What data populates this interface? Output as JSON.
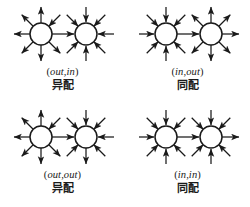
{
  "figure": {
    "type": "diagram",
    "title": "",
    "layout": "2x2-grid",
    "panel_count": 4
  },
  "panels": [
    {
      "id": "panel-out-in",
      "position": "top-left",
      "pair_open": "(",
      "pair_first": "out",
      "pair_comma": ",",
      "pair_second": "in",
      "pair_close": ")",
      "pair_label": "(out,in)",
      "cn_label": "异配",
      "left_node": {
        "name": "left-node",
        "hub_type": "out",
        "spoke_count": 8
      },
      "right_node": {
        "name": "right-node",
        "hub_type": "in",
        "spoke_count": 8
      },
      "edge_direction": "left-to-right"
    },
    {
      "id": "panel-in-out",
      "position": "top-right",
      "pair_open": "(",
      "pair_first": "in",
      "pair_comma": ",",
      "pair_second": "out",
      "pair_close": ")",
      "pair_label": "(in,out)",
      "cn_label": "同配",
      "left_node": {
        "name": "left-node",
        "hub_type": "in",
        "spoke_count": 8
      },
      "right_node": {
        "name": "right-node",
        "hub_type": "out",
        "spoke_count": 8
      },
      "edge_direction": "left-to-right"
    },
    {
      "id": "panel-out-out",
      "position": "bottom-left",
      "pair_open": "(",
      "pair_first": "out",
      "pair_comma": ",",
      "pair_second": "out",
      "pair_close": ")",
      "pair_label": "(out,out)",
      "cn_label": "异配",
      "left_node": {
        "name": "left-node",
        "hub_type": "out",
        "spoke_count": 8
      },
      "right_node": {
        "name": "right-node",
        "hub_type": "in",
        "spoke_count": 8
      },
      "edge_direction": "left-to-right"
    },
    {
      "id": "panel-in-in",
      "position": "bottom-right",
      "pair_open": "(",
      "pair_first": "in",
      "pair_comma": ",",
      "pair_second": "in",
      "pair_close": ")",
      "pair_label": "(in,in)",
      "cn_label": "同配",
      "left_node": {
        "name": "left-node",
        "hub_type": "in",
        "spoke_count": 8
      },
      "right_node": {
        "name": "right-node",
        "hub_type": "in",
        "spoke_count": 8
      },
      "edge_direction": "left-to-right"
    }
  ],
  "colors": {
    "stroke": "#1a1a1a",
    "node_fill": "#ffffff",
    "background": "#ffffff",
    "text": "#1a1a1a"
  }
}
